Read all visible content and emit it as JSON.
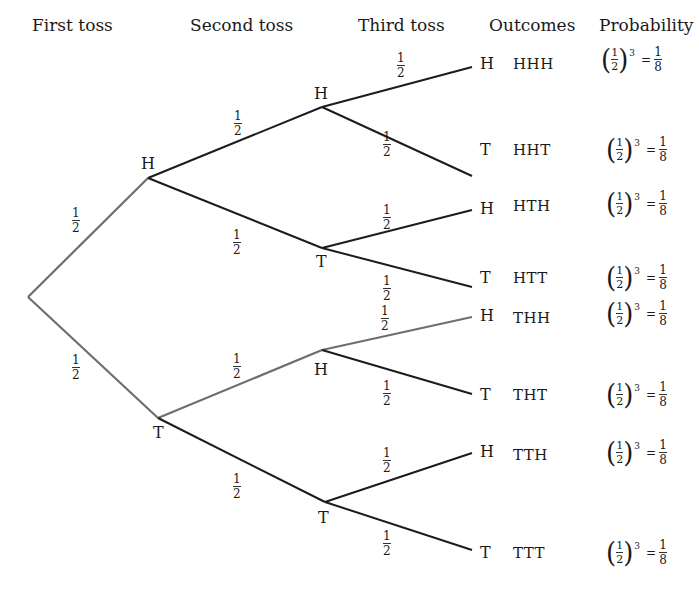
{
  "headers": {
    "first_toss": "First toss",
    "second_toss": "Second toss",
    "third_toss": "Third toss",
    "outcomes": "Outcomes",
    "probability": "Probability"
  },
  "colors": {
    "line_dark": "#1c1c1c",
    "line_highlight": "#6e6e6e",
    "text": "#1a1a1a"
  },
  "branch_probability": {
    "numerator": "1",
    "denominator": "2"
  },
  "nodes": {
    "first": [
      {
        "label": "H",
        "x": 148,
        "y": 178
      },
      {
        "label": "T",
        "x": 158,
        "y": 418
      }
    ],
    "second": [
      {
        "label": "H",
        "x": 322,
        "y": 107
      },
      {
        "label": "T",
        "x": 322,
        "y": 248
      },
      {
        "label": "H",
        "x": 322,
        "y": 350
      },
      {
        "label": "T",
        "x": 325,
        "y": 502
      }
    ]
  },
  "leaves": [
    {
      "label": "H",
      "outcome": "HHH",
      "y": 67
    },
    {
      "label": "T",
      "outcome": "HHT",
      "y": 176
    },
    {
      "label": "H",
      "outcome": "HTH",
      "y": 238
    },
    {
      "label": "T",
      "outcome": "HTT",
      "y": 287
    },
    {
      "label": "H",
      "outcome": "THH",
      "y": 318
    },
    {
      "label": "T",
      "outcome": "THT",
      "y": 429
    },
    {
      "label": "H",
      "outcome": "TTH",
      "y": 487
    },
    {
      "label": "T",
      "outcome": "TTT",
      "y": 566
    }
  ],
  "probability_expr": {
    "base_num": "1",
    "base_den": "2",
    "open_paren": "(",
    "close_paren": ")",
    "exponent": "3",
    "equals": "=",
    "result_num": "1",
    "result_den": "8"
  },
  "highlighted_path": [
    "root-T",
    "T-TH",
    "TH-THH",
    "root-H"
  ]
}
